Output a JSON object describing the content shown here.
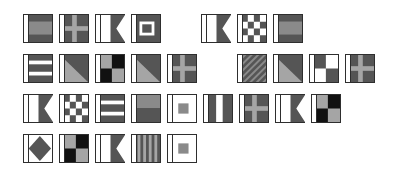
{
  "colors": {
    "dark": "#555555",
    "mid": "#8a8a8a",
    "light": "#a5a5a5",
    "white": "#ffffff",
    "black": "#111111",
    "border": "#2e2e2e"
  },
  "flags": [
    {
      "row": 0,
      "x": 23,
      "y": 14,
      "type": "horiz-dark-light-dark"
    },
    {
      "row": 0,
      "x": 59,
      "y": 14,
      "type": "cross"
    },
    {
      "row": 0,
      "x": 95,
      "y": 14,
      "type": "swallowtail"
    },
    {
      "row": 0,
      "x": 131,
      "y": 14,
      "type": "square-in-square"
    },
    {
      "row": 0,
      "x": 201,
      "y": 14,
      "type": "swallowtail"
    },
    {
      "row": 0,
      "x": 237,
      "y": 14,
      "type": "checker"
    },
    {
      "row": 0,
      "x": 273,
      "y": 14,
      "type": "horiz-dark-light-dark"
    },
    {
      "row": 1,
      "x": 23,
      "y": 54,
      "type": "horiz-stripes"
    },
    {
      "row": 1,
      "x": 59,
      "y": 54,
      "type": "diagonal"
    },
    {
      "row": 1,
      "x": 95,
      "y": 54,
      "type": "quarters-black"
    },
    {
      "row": 1,
      "x": 131,
      "y": 54,
      "type": "diagonal"
    },
    {
      "row": 1,
      "x": 167,
      "y": 54,
      "type": "cross"
    },
    {
      "row": 1,
      "x": 237,
      "y": 54,
      "type": "diag-stripes"
    },
    {
      "row": 1,
      "x": 273,
      "y": 54,
      "type": "diagonal"
    },
    {
      "row": 1,
      "x": 309,
      "y": 54,
      "type": "quarters-white"
    },
    {
      "row": 1,
      "x": 345,
      "y": 54,
      "type": "cross"
    },
    {
      "row": 2,
      "x": 23,
      "y": 94,
      "type": "swallowtail"
    },
    {
      "row": 2,
      "x": 59,
      "y": 94,
      "type": "checker"
    },
    {
      "row": 2,
      "x": 95,
      "y": 94,
      "type": "horiz-stripes"
    },
    {
      "row": 2,
      "x": 131,
      "y": 94,
      "type": "horiz-two"
    },
    {
      "row": 2,
      "x": 167,
      "y": 94,
      "type": "white-center-square"
    },
    {
      "row": 2,
      "x": 203,
      "y": 94,
      "type": "vert-stripes"
    },
    {
      "row": 2,
      "x": 239,
      "y": 94,
      "type": "cross"
    },
    {
      "row": 2,
      "x": 275,
      "y": 94,
      "type": "swallowtail"
    },
    {
      "row": 2,
      "x": 311,
      "y": 94,
      "type": "quarters-black"
    },
    {
      "row": 3,
      "x": 23,
      "y": 134,
      "type": "diamond"
    },
    {
      "row": 3,
      "x": 59,
      "y": 134,
      "type": "quarters-black"
    },
    {
      "row": 3,
      "x": 95,
      "y": 134,
      "type": "swallowtail"
    },
    {
      "row": 3,
      "x": 131,
      "y": 134,
      "type": "vert-many"
    },
    {
      "row": 3,
      "x": 167,
      "y": 134,
      "type": "white-center-square"
    }
  ]
}
